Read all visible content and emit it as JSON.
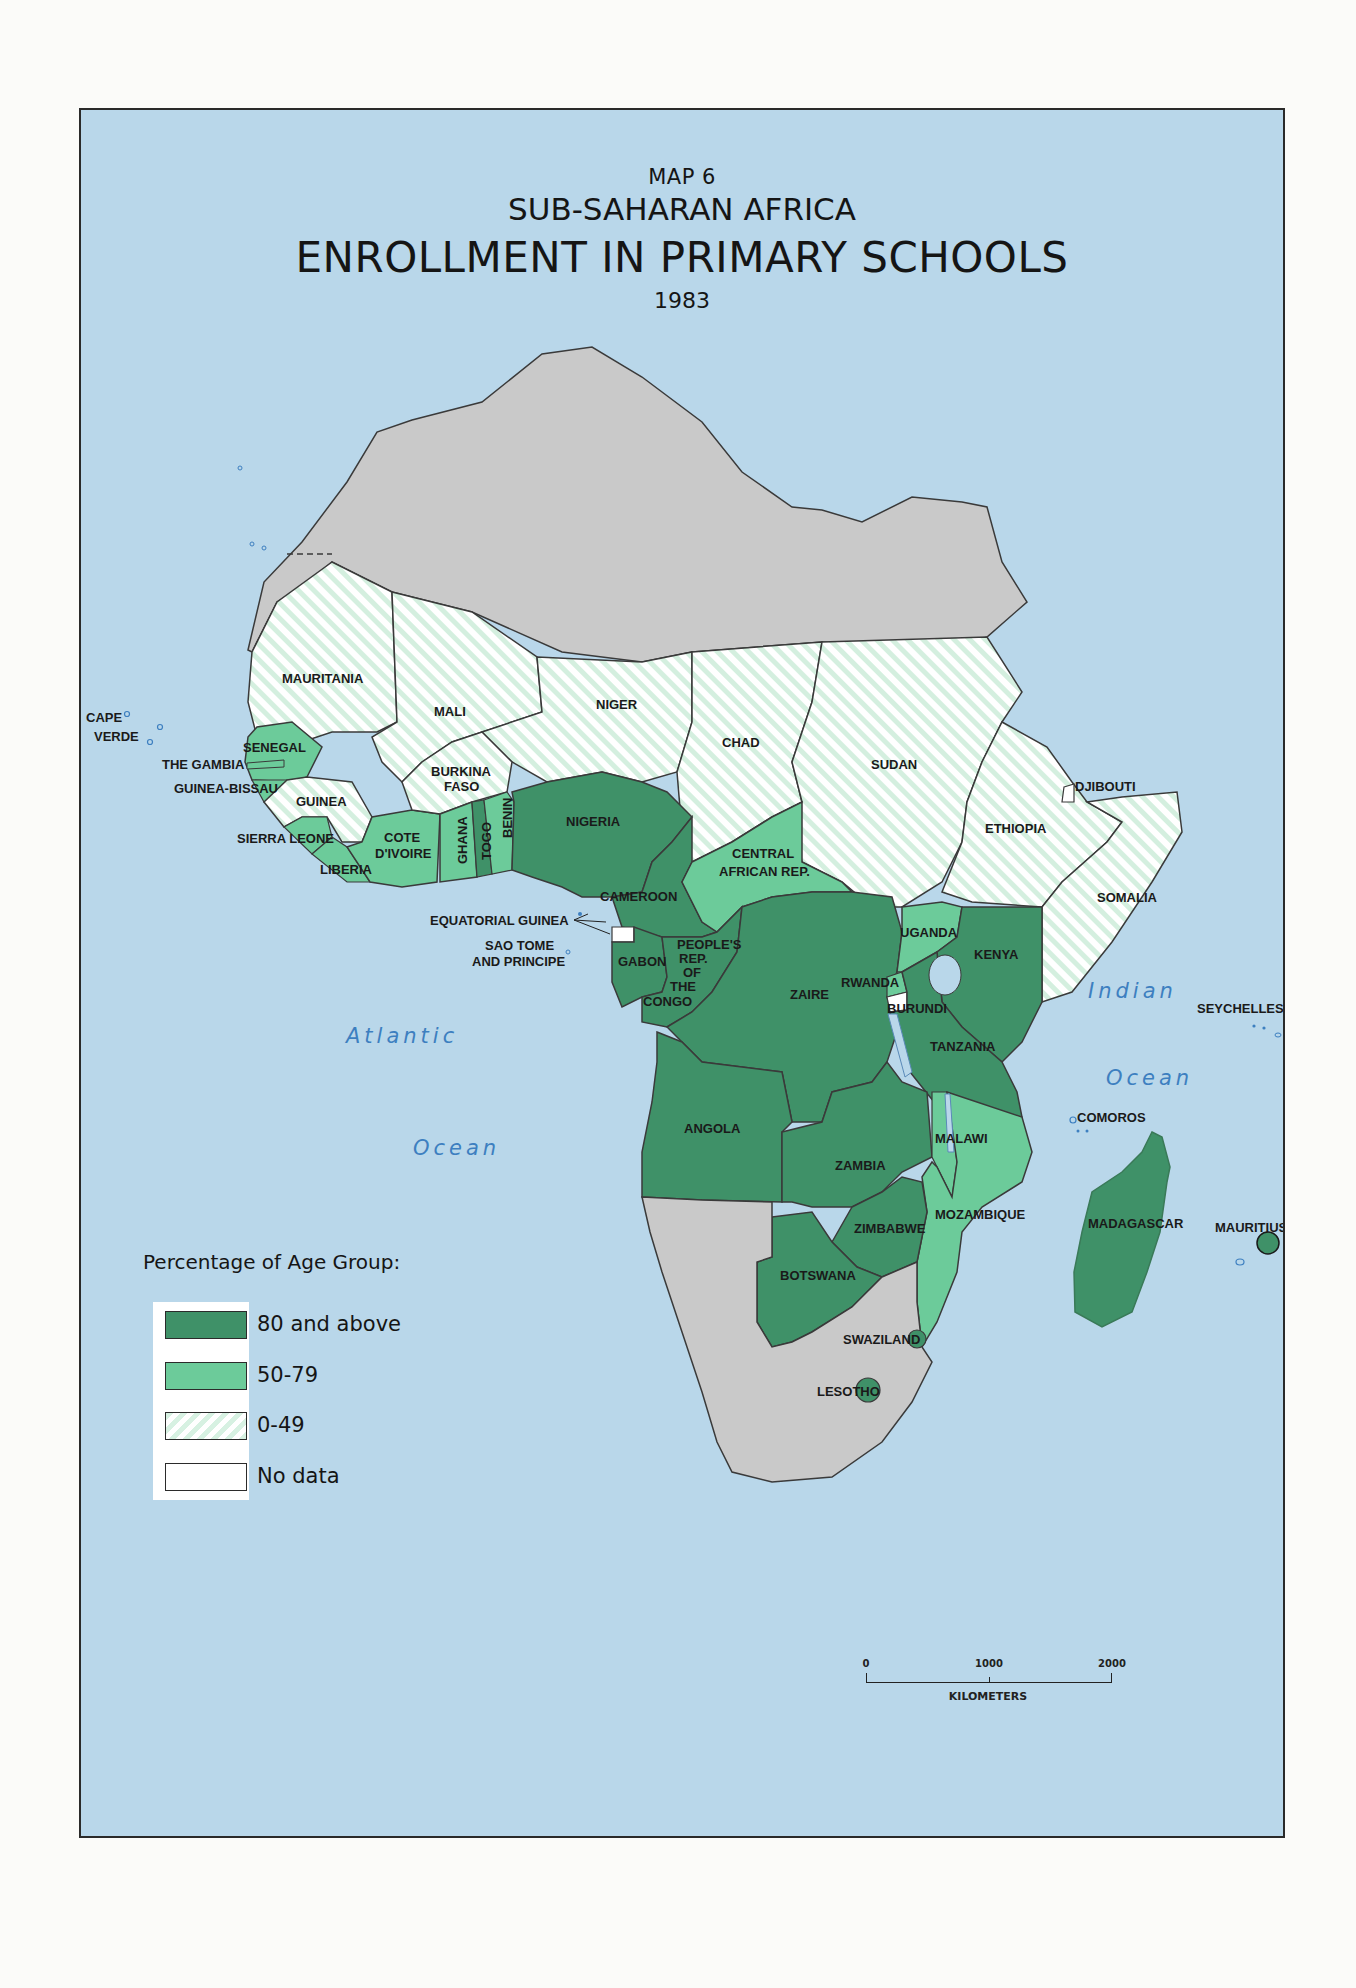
{
  "title": {
    "map_number": "MAP 6",
    "region": "SUB-SAHARAN AFRICA",
    "main": "ENROLLMENT IN PRIMARY SCHOOLS",
    "year": "1983"
  },
  "legend": {
    "title": "Percentage of Age Group:",
    "items": [
      {
        "label": "80 and above",
        "color": "#3f9168",
        "pattern": "solid"
      },
      {
        "label": "50-79",
        "color": "#6ccb9a",
        "pattern": "solid"
      },
      {
        "label": "0-49",
        "color": "#d7f1e2",
        "pattern": "diagonal-hatch"
      },
      {
        "label": "No data",
        "color": "#ffffff",
        "pattern": "solid"
      }
    ]
  },
  "scale_bar": {
    "ticks": [
      "0",
      "1000",
      "2000"
    ],
    "unit": "KILOMETERS"
  },
  "oceans": {
    "atlantic_1": "Atlantic",
    "atlantic_2": "Ocean",
    "indian_1": "Indian",
    "indian_2": "Ocean"
  },
  "colors": {
    "water": "#b9d7ea",
    "non_sub_saharan": "#c9c9c9",
    "cat_80_plus": "#3f9168",
    "cat_50_79": "#6ccb9a",
    "cat_0_49": "#d7f1e2",
    "no_data": "#ffffff",
    "ocean_label": "#3d7fc0"
  },
  "countries": [
    {
      "name": "MAURITANIA",
      "category": "0-49"
    },
    {
      "name": "MALI",
      "category": "0-49"
    },
    {
      "name": "NIGER",
      "category": "0-49"
    },
    {
      "name": "CHAD",
      "category": "0-49"
    },
    {
      "name": "SUDAN",
      "category": "0-49"
    },
    {
      "name": "ETHIOPIA",
      "category": "0-49"
    },
    {
      "name": "SOMALIA",
      "category": "0-49"
    },
    {
      "name": "DJIBOUTI",
      "category": "No data"
    },
    {
      "name": "CAPE VERDE",
      "category": "50-79"
    },
    {
      "name": "SENEGAL",
      "category": "50-79"
    },
    {
      "name": "THE GAMBIA",
      "category": "50-79"
    },
    {
      "name": "GUINEA-BISSAU",
      "category": "50-79"
    },
    {
      "name": "GUINEA",
      "category": "0-49"
    },
    {
      "name": "SIERRA LEONE",
      "category": "50-79"
    },
    {
      "name": "LIBERIA",
      "category": "50-79"
    },
    {
      "name": "COTE D'IVOIRE",
      "category": "50-79"
    },
    {
      "name": "BURKINA FASO",
      "category": "0-49"
    },
    {
      "name": "GHANA",
      "category": "50-79"
    },
    {
      "name": "TOGO",
      "category": "80 and above"
    },
    {
      "name": "BENIN",
      "category": "50-79"
    },
    {
      "name": "NIGERIA",
      "category": "80 and above"
    },
    {
      "name": "CAMEROON",
      "category": "80 and above"
    },
    {
      "name": "CENTRAL AFRICAN REP.",
      "category": "50-79"
    },
    {
      "name": "EQUATORIAL GUINEA",
      "category": "No data"
    },
    {
      "name": "SAO TOME AND PRINCIPE",
      "category": "No data"
    },
    {
      "name": "GABON",
      "category": "80 and above"
    },
    {
      "name": "PEOPLE'S REP. OF THE CONGO",
      "category": "80 and above"
    },
    {
      "name": "ZAIRE",
      "category": "80 and above"
    },
    {
      "name": "UGANDA",
      "category": "50-79"
    },
    {
      "name": "KENYA",
      "category": "80 and above"
    },
    {
      "name": "RWANDA",
      "category": "50-79"
    },
    {
      "name": "BURUNDI",
      "category": "No data"
    },
    {
      "name": "TANZANIA",
      "category": "80 and above"
    },
    {
      "name": "ANGOLA",
      "category": "80 and above"
    },
    {
      "name": "ZAMBIA",
      "category": "80 and above"
    },
    {
      "name": "MALAWI",
      "category": "50-79"
    },
    {
      "name": "MOZAMBIQUE",
      "category": "50-79"
    },
    {
      "name": "ZIMBABWE",
      "category": "80 and above"
    },
    {
      "name": "BOTSWANA",
      "category": "80 and above"
    },
    {
      "name": "SWAZILAND",
      "category": "80 and above"
    },
    {
      "name": "LESOTHO",
      "category": "80 and above"
    },
    {
      "name": "MADAGASCAR",
      "category": "80 and above"
    },
    {
      "name": "COMOROS",
      "category": "No data"
    },
    {
      "name": "MAURITIUS",
      "category": "80 and above"
    },
    {
      "name": "SEYCHELLES",
      "category": "No data"
    }
  ],
  "labels": {
    "mauritania": "MAURITANIA",
    "mali": "MALI",
    "niger": "NIGER",
    "chad": "CHAD",
    "sudan": "SUDAN",
    "ethiopia": "ETHIOPIA",
    "somalia": "SOMALIA",
    "djibouti": "DJIBOUTI",
    "cape_verde_1": "CAPE",
    "cape_verde_2": "VERDE",
    "senegal": "SENEGAL",
    "gambia": "THE GAMBIA",
    "guinea_bissau": "GUINEA-BISSAU",
    "guinea": "GUINEA",
    "sierra_leone": "SIERRA LEONE",
    "liberia": "LIBERIA",
    "cote_1": "COTE",
    "cote_2": "D'IVOIRE",
    "burkina_1": "BURKINA",
    "burkina_2": "FASO",
    "ghana": "GHANA",
    "togo": "TOGO",
    "benin": "BENIN",
    "nigeria": "NIGERIA",
    "cameroon": "CAMEROON",
    "car_1": "CENTRAL",
    "car_2": "AFRICAN REP.",
    "eq_guinea": "EQUATORIAL GUINEA",
    "sao_tome_1": "SAO TOME",
    "sao_tome_2": "AND PRINCIPE",
    "gabon": "GABON",
    "congo_1": "PEOPLE'S",
    "congo_2": "REP.",
    "congo_3": "OF",
    "congo_4": "THE",
    "congo_5": "CONGO",
    "zaire": "ZAIRE",
    "uganda": "UGANDA",
    "kenya": "KENYA",
    "rwanda": "RWANDA",
    "burundi": "BURUNDI",
    "tanzania": "TANZANIA",
    "angola": "ANGOLA",
    "zambia": "ZAMBIA",
    "malawi": "MALAWI",
    "mozambique": "MOZAMBIQUE",
    "zimbabwe": "ZIMBABWE",
    "botswana": "BOTSWANA",
    "swaziland": "SWAZILAND",
    "lesotho": "LESOTHO",
    "madagascar": "MADAGASCAR",
    "comoros": "COMOROS",
    "mauritius": "MAURITIUS",
    "seychelles": "SEYCHELLES"
  }
}
